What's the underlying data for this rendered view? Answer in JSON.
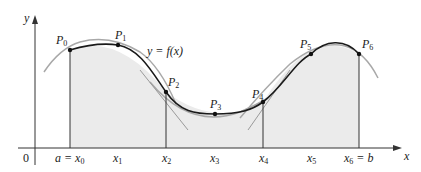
{
  "diagram": {
    "curve_label": "y = f(x)",
    "axes": {
      "x_label": "x",
      "y_label": "y",
      "origin_label": "0"
    },
    "x_ticks": [
      {
        "main": "a = x",
        "sub": "0"
      },
      {
        "main": "x",
        "sub": "1"
      },
      {
        "main": "x",
        "sub": "2"
      },
      {
        "main": "x",
        "sub": "3"
      },
      {
        "main": "x",
        "sub": "4"
      },
      {
        "main": "x",
        "sub": "5"
      },
      {
        "main": "x",
        "sub": "6",
        "suffix": " = b"
      }
    ],
    "points": [
      {
        "main": "P",
        "sub": "0"
      },
      {
        "main": "P",
        "sub": "1"
      },
      {
        "main": "P",
        "sub": "2"
      },
      {
        "main": "P",
        "sub": "3"
      },
      {
        "main": "P",
        "sub": "4"
      },
      {
        "main": "P",
        "sub": "5"
      },
      {
        "main": "P",
        "sub": "6"
      }
    ],
    "colors": {
      "curve": "#1a1a1a",
      "parabola": "#a6a6a6",
      "fill": "#ebebeb",
      "axis": "#333333"
    }
  }
}
